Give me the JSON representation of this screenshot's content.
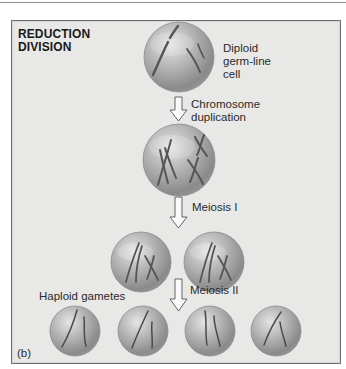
{
  "figure": {
    "title_line1": "REDUCTION",
    "title_line2": "DIVISION",
    "panel_label": "(b)",
    "colors": {
      "background": "#e8e8e6",
      "border": "#6e6e6e",
      "cell_light": "#d9d9d9",
      "cell_dark": "#7d7d7d",
      "chromosome": "#4a4a4a",
      "text": "#2a2a2a"
    }
  },
  "stages": [
    {
      "id": "diploid",
      "label_lines": [
        "Diploid",
        "germ-line",
        "cell"
      ],
      "cell_count": 1
    },
    {
      "id": "duplication",
      "arrow_label_lines": [
        "Chromosome",
        "duplication"
      ],
      "cell_count": 1
    },
    {
      "id": "meiosis1",
      "arrow_label": "Meiosis I",
      "cell_count": 2
    },
    {
      "id": "meiosis2",
      "arrow_label": "Meiosis II",
      "result_label": "Haploid gametes",
      "cell_count": 4
    }
  ]
}
